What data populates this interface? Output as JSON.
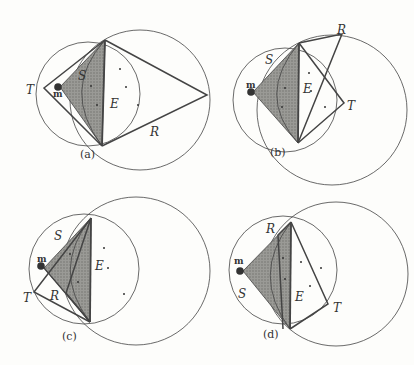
{
  "figure": {
    "panels": [
      {
        "id": "a",
        "caption": "(a)",
        "labels": {
          "T": "T",
          "S": "S",
          "E": "E",
          "R": "R",
          "m": "m"
        }
      },
      {
        "id": "b",
        "caption": "(b)",
        "labels": {
          "R": "R",
          "S": "S",
          "E": "E",
          "T": "T",
          "m": "m"
        }
      },
      {
        "id": "c",
        "caption": "(c)",
        "labels": {
          "S": "S",
          "E": "E",
          "T": "T",
          "R": "R",
          "m": "m"
        }
      },
      {
        "id": "d",
        "caption": "(d)",
        "labels": {
          "R": "R",
          "S": "S",
          "E": "E",
          "T": "T",
          "m": "m"
        }
      }
    ]
  }
}
